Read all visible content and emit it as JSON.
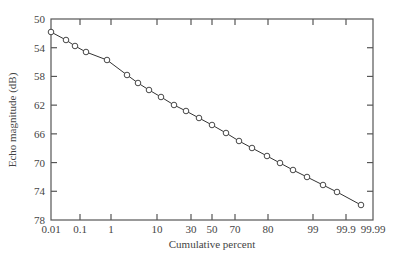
{
  "chart_data": {
    "type": "line",
    "title": "",
    "xlabel": "Cumulative percent",
    "ylabel": "Echo magnitude (dB)",
    "x_scale": "normal-probability",
    "y_inverted": true,
    "ylim": [
      50,
      78
    ],
    "grid": false,
    "legend": null,
    "x_ticks": [
      {
        "label": "0.01",
        "px": 51
      },
      {
        "label": "0.1",
        "px": 80
      },
      {
        "label": "1",
        "px": 111
      },
      {
        "label": "10",
        "px": 157
      },
      {
        "label": "30",
        "px": 191
      },
      {
        "label": "50",
        "px": 212
      },
      {
        "label": "70",
        "px": 235
      },
      {
        "label": "80",
        "px": 268
      },
      {
        "label": "99",
        "px": 313
      },
      {
        "label": "99.9",
        "px": 346
      },
      {
        "label": "99.99",
        "px": 373
      }
    ],
    "y_ticks": [
      "50",
      "54",
      "58",
      "62",
      "66",
      "70",
      "74",
      "78"
    ],
    "series": [
      {
        "name": "Echo magnitude",
        "marker": "open-circle",
        "points": [
          {
            "x": 0.01,
            "y": 51.8,
            "px": 51,
            "py": 32
          },
          {
            "x": 0.05,
            "y": 52.9,
            "px": 66,
            "py": 40
          },
          {
            "x": 0.1,
            "y": 53.8,
            "px": 75,
            "py": 46
          },
          {
            "x": 0.2,
            "y": 54.6,
            "px": 86,
            "py": 52
          },
          {
            "x": 0.8,
            "y": 55.7,
            "px": 107,
            "py": 60
          },
          {
            "x": 3,
            "y": 57.8,
            "px": 127,
            "py": 75
          },
          {
            "x": 5,
            "y": 58.9,
            "px": 138,
            "py": 83
          },
          {
            "x": 8,
            "y": 59.9,
            "px": 149,
            "py": 90
          },
          {
            "x": 12,
            "y": 60.9,
            "px": 161,
            "py": 97
          },
          {
            "x": 18,
            "y": 62.0,
            "px": 174,
            "py": 105
          },
          {
            "x": 25,
            "y": 62.8,
            "px": 186,
            "py": 111
          },
          {
            "x": 32,
            "y": 63.8,
            "px": 199,
            "py": 118
          },
          {
            "x": 42,
            "y": 64.8,
            "px": 212,
            "py": 125
          },
          {
            "x": 52,
            "y": 65.9,
            "px": 226,
            "py": 133
          },
          {
            "x": 62,
            "y": 67.0,
            "px": 239,
            "py": 141
          },
          {
            "x": 72,
            "y": 68.0,
            "px": 252,
            "py": 148
          },
          {
            "x": 81,
            "y": 69.1,
            "px": 267,
            "py": 156
          },
          {
            "x": 88,
            "y": 70.1,
            "px": 280,
            "py": 163
          },
          {
            "x": 93,
            "y": 71.0,
            "px": 293,
            "py": 170
          },
          {
            "x": 97,
            "y": 72.0,
            "px": 307,
            "py": 177
          },
          {
            "x": 99,
            "y": 73.1,
            "px": 323,
            "py": 185
          },
          {
            "x": 99.7,
            "y": 74.1,
            "px": 337,
            "py": 192
          },
          {
            "x": 99.99,
            "y": 75.9,
            "px": 361,
            "py": 205
          }
        ]
      }
    ]
  },
  "colors": {
    "axis": "#555555",
    "line": "#333333",
    "marker_fill": "#ffffff",
    "text": "#444444"
  }
}
